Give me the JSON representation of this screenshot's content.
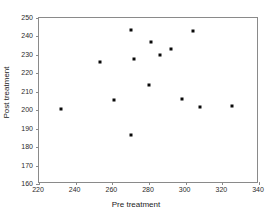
{
  "chart_data": {
    "type": "scatter",
    "title": "",
    "xlabel": "Pre treatment",
    "ylabel": "Post treatment",
    "xlim": [
      220,
      340
    ],
    "ylim": [
      160,
      250
    ],
    "xticks": [
      220,
      240,
      260,
      280,
      300,
      320,
      340
    ],
    "yticks": [
      160,
      170,
      180,
      190,
      200,
      210,
      220,
      230,
      240,
      250
    ],
    "grid": false,
    "legend": null,
    "marker": "square",
    "marker_color": "#0a0a0a",
    "points": [
      {
        "x": 232,
        "y": 200.7
      },
      {
        "x": 253,
        "y": 226.2
      },
      {
        "x": 261,
        "y": 205.3
      },
      {
        "x": 270,
        "y": 243.6
      },
      {
        "x": 270,
        "y": 186.3
      },
      {
        "x": 272,
        "y": 227.6
      },
      {
        "x": 280,
        "y": 213.5
      },
      {
        "x": 281,
        "y": 237.0
      },
      {
        "x": 286,
        "y": 230.0
      },
      {
        "x": 292,
        "y": 233.1
      },
      {
        "x": 298,
        "y": 206.1
      },
      {
        "x": 304,
        "y": 242.7
      },
      {
        "x": 308,
        "y": 201.6
      },
      {
        "x": 325,
        "y": 202.2
      }
    ]
  }
}
